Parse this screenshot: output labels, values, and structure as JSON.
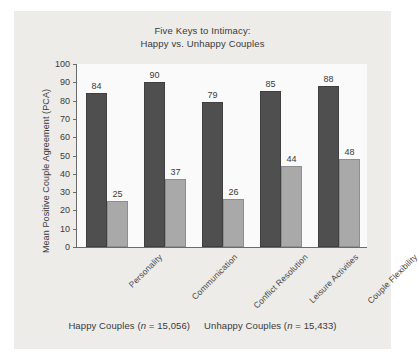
{
  "chart_data": {
    "type": "bar",
    "title": "Five Keys to Intimacy:\nHappy vs. Unhappy Couples",
    "title_line1": "Five Keys to Intimacy:",
    "title_line2": "Happy vs. Unhappy Couples",
    "xlabel": "",
    "ylabel": "Mean Positive Couple Agreement (PCA)",
    "ylim": [
      0,
      100
    ],
    "ytick_step": 10,
    "yticks": [
      0,
      10,
      20,
      30,
      40,
      50,
      60,
      70,
      80,
      90,
      100
    ],
    "grid": false,
    "legend_position": "below",
    "categories": [
      "Personality",
      "Communication",
      "Conflict Resolution",
      "Leisure Activities",
      "Couple Flexibility"
    ],
    "series": [
      {
        "name": "Happy Couples",
        "color": "#4f4f4f",
        "values": [
          84,
          90,
          79,
          85,
          88
        ]
      },
      {
        "name": "Unhappy Couples",
        "color": "#a9a9a9",
        "values": [
          25,
          37,
          26,
          44,
          48
        ]
      }
    ],
    "legend_entries": [
      {
        "label": "Happy Couples",
        "n_prefix": "(",
        "n_symbol": "n",
        "n_value": " = 15,056)"
      },
      {
        "label": "Unhappy Couples",
        "n_prefix": "(",
        "n_symbol": "n",
        "n_value": " = 15,433)"
      }
    ],
    "colors": {
      "happy": "#4f4f4f",
      "unhappy": "#a9a9a9",
      "panel_background": "#edece9",
      "plot_background": "#fafafa",
      "axis": "#6b6b6b",
      "text": "#3a3a3a"
    }
  }
}
